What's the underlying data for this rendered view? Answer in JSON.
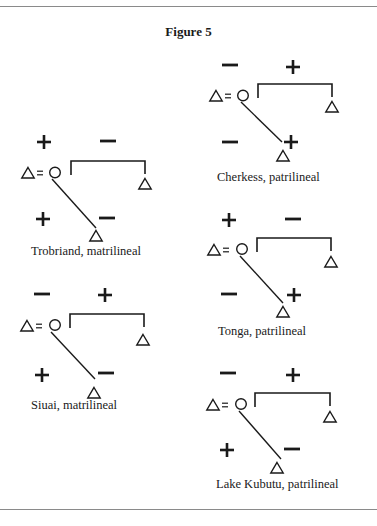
{
  "figure": {
    "title": "Figure 5",
    "diagrams": [
      {
        "id": "cherkess",
        "label": "Cherkess, patrilineal",
        "top_left": "−",
        "top_right": "+",
        "bottom_left": "−",
        "bottom_right": "+"
      },
      {
        "id": "trobriand",
        "label": "Trobriand, matrilineal",
        "top_left": "+",
        "top_right": "−",
        "bottom_left": "+",
        "bottom_right": "−"
      },
      {
        "id": "tonga",
        "label": "Tonga, patrilineal",
        "top_left": "+",
        "top_right": "−",
        "bottom_left": "−",
        "bottom_right": "+"
      },
      {
        "id": "siuai",
        "label": "Siuai, matrilineal",
        "top_left": "−",
        "top_right": "+",
        "bottom_left": "+",
        "bottom_right": "−"
      },
      {
        "id": "lake-kubutu",
        "label": "Lake Kubutu, patrilineal",
        "top_left": "−",
        "top_right": "+",
        "bottom_left": "+",
        "bottom_right": "−"
      }
    ],
    "legend_symbols": {
      "male": "triangle",
      "female": "circle",
      "marriage": "="
    }
  }
}
